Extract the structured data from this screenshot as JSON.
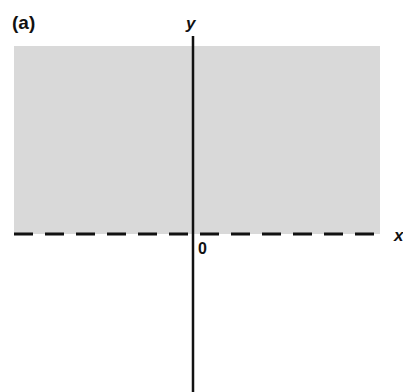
{
  "figure": {
    "panel_label": "(a)",
    "x_axis_label": "x",
    "y_axis_label": "y",
    "origin_label": "0",
    "shaded_region": {
      "description": "half-plane y > 0 (boundary excluded)",
      "color": "#d9d9d9"
    },
    "boundary_line": {
      "style": "dashed",
      "equation": "y = 0"
    }
  }
}
